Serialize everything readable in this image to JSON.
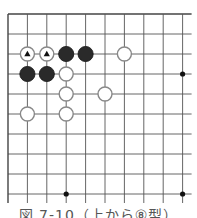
{
  "diagram": {
    "type": "go-board-fragment",
    "grid": {
      "origin_x": 8,
      "origin_y": 14,
      "spacing_x": 19.4,
      "spacing_y": 20,
      "cols": 10,
      "rows": 10,
      "open_right": true,
      "open_bottom": true,
      "line_color": "#555555",
      "edge_color": "#444444"
    },
    "star_points": [
      {
        "col": 9,
        "row": 3
      },
      {
        "col": 3,
        "row": 9
      },
      {
        "col": 9,
        "row": 9
      }
    ],
    "stones": [
      {
        "color": "white",
        "col": 1,
        "row": 2,
        "mark": "triangle"
      },
      {
        "color": "white",
        "col": 2,
        "row": 2,
        "mark": "triangle"
      },
      {
        "color": "black",
        "col": 3,
        "row": 2
      },
      {
        "color": "black",
        "col": 4,
        "row": 2
      },
      {
        "color": "white",
        "col": 6,
        "row": 2
      },
      {
        "color": "black",
        "col": 1,
        "row": 3
      },
      {
        "color": "black",
        "col": 2,
        "row": 3
      },
      {
        "color": "white",
        "col": 3,
        "row": 3
      },
      {
        "color": "white",
        "col": 3,
        "row": 4
      },
      {
        "color": "white",
        "col": 5,
        "row": 4
      },
      {
        "color": "white",
        "col": 1,
        "row": 5
      },
      {
        "color": "white",
        "col": 3,
        "row": 5
      }
    ],
    "colors": {
      "black_stone": "#2a2a2a",
      "white_stone_fill": "#ffffff",
      "white_stone_stroke": "#888888",
      "triangle": "#111111"
    }
  },
  "caption": {
    "text": "図 7-10（上から⑧型）"
  }
}
